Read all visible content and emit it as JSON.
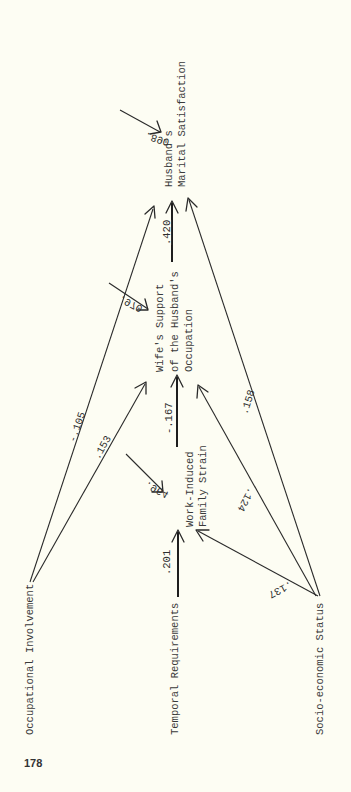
{
  "page": {
    "number": "178",
    "background": "#fdfdf3",
    "ink": "#2a2a2a"
  },
  "diagram": {
    "type": "path-diagram",
    "orientation": "rotated-90-ccw",
    "nodes": {
      "occupational_involvement": {
        "lines": [
          "Occupational Involvement"
        ]
      },
      "temporal_requirements": {
        "lines": [
          "Temporal Requirements"
        ]
      },
      "socioeconomic_status": {
        "lines": [
          "Socio-economic Status"
        ]
      },
      "work_induced_family_strain": {
        "lines": [
          "Work-Induced",
          "Family Strain"
        ]
      },
      "wifes_support": {
        "lines": [
          "Wife's Support",
          "of the Husband's",
          "Occupation"
        ]
      },
      "husbands_marital_satisfaction": {
        "lines": [
          "Husband's",
          "Marital Satisfaction"
        ]
      }
    },
    "paths": [
      {
        "from": "temporal_requirements",
        "to": "work_induced_family_strain",
        "coefficient": ".201",
        "style": "thick"
      },
      {
        "from": "work_induced_family_strain",
        "to": "wifes_support",
        "coefficient": "-.167",
        "style": "thick"
      },
      {
        "from": "wifes_support",
        "to": "husbands_marital_satisfaction",
        "coefficient": ".420",
        "style": "thick"
      },
      {
        "from": "occupational_involvement",
        "to": "husbands_marital_satisfaction",
        "coefficient": "-.105",
        "style": "thin"
      },
      {
        "from": "occupational_involvement",
        "to": "wifes_support",
        "coefficient": ".153",
        "style": "thin"
      },
      {
        "from": "socioeconomic_status",
        "to": "work_induced_family_strain",
        "coefficient": ".137",
        "style": "thin"
      },
      {
        "from": "socioeconomic_status",
        "to": "wifes_support",
        "coefficient": ".124",
        "style": "thin"
      },
      {
        "from": "socioeconomic_status",
        "to": "husbands_marital_satisfaction",
        "coefficient": ".158",
        "style": "thin"
      }
    ],
    "residuals": [
      {
        "to": "work_induced_family_strain",
        "coefficient": ".964"
      },
      {
        "to": "wifes_support",
        "coefficient": ".970"
      },
      {
        "to": "husbands_marital_satisfaction",
        "coefficient": ".890"
      }
    ]
  }
}
